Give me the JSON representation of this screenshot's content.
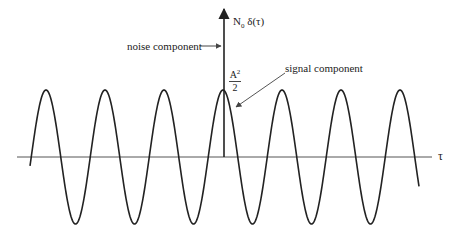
{
  "diagram": {
    "axis": {
      "label": "τ",
      "y": 157,
      "x_start": 17,
      "x_end": 432
    },
    "impulse": {
      "label_main": "N",
      "label_sub": "0",
      "label_tail": " δ(τ)",
      "x": 224,
      "y_top": 8,
      "y_base": 157
    },
    "wave": {
      "x_start": 30,
      "x_end": 419,
      "period": 59,
      "peak_x": 223,
      "baseline_y": 157,
      "amplitude": 67
    },
    "annotations": {
      "noise": "noise component",
      "signal": "signal component",
      "peak_value_num": "A",
      "peak_value_sup": "2",
      "peak_value_den": "2"
    },
    "colors": {
      "line": "#222222",
      "axis": "#555555",
      "arrow": "#666666"
    }
  }
}
